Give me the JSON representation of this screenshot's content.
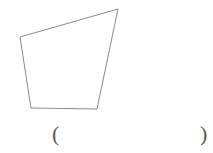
{
  "page": {
    "background_color": "#ffffff",
    "width": 213,
    "height": 153
  },
  "figure": {
    "name": "quadrilateral",
    "shape_type": "quadrilateral",
    "stroke_color": "#8a8a8a",
    "stroke_width": 1,
    "fill": "none",
    "vertices": [
      {
        "label": "top-left",
        "x": 20,
        "y": 37
      },
      {
        "label": "top-right",
        "x": 118,
        "y": 9
      },
      {
        "label": "bottom-right",
        "x": 97,
        "y": 109
      },
      {
        "label": "bottom-left",
        "x": 31,
        "y": 108
      }
    ],
    "points_attr": "20,37 118,9 97,109 31,108"
  },
  "answer": {
    "open_paren": "(",
    "close_paren": ")",
    "value": "",
    "placeholder": ""
  }
}
